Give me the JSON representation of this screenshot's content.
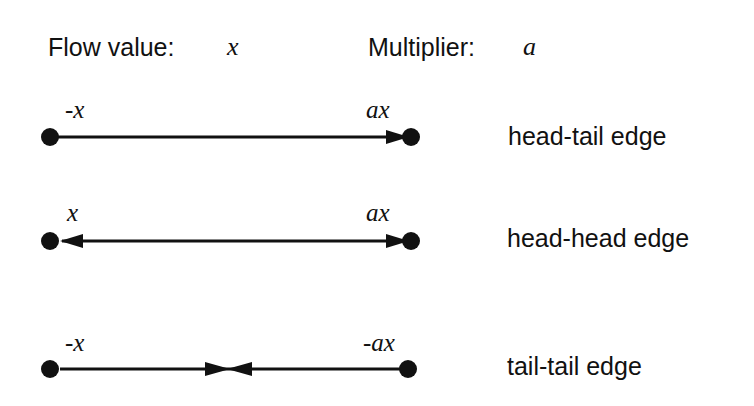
{
  "header": {
    "flow_label": "Flow value:",
    "flow_var": "x",
    "multiplier_label": "Multiplier:",
    "multiplier_var": "a"
  },
  "edges": [
    {
      "name": "head-tail edge",
      "left_value": "-x",
      "right_value": "ax",
      "left_arrow": "none",
      "right_arrow": "head-into-node",
      "middle_arrows": "none"
    },
    {
      "name": "head-head edge",
      "left_value": "x",
      "right_value": "ax",
      "left_arrow": "head-into-node",
      "right_arrow": "head-into-node",
      "middle_arrows": "none"
    },
    {
      "name": "tail-tail edge",
      "left_value": "-x",
      "right_value": "-ax",
      "left_arrow": "none",
      "right_arrow": "none",
      "middle_arrows": "bowtie-opposing-heads"
    }
  ],
  "colors": {
    "ink": "#111111",
    "background": "#ffffff"
  }
}
